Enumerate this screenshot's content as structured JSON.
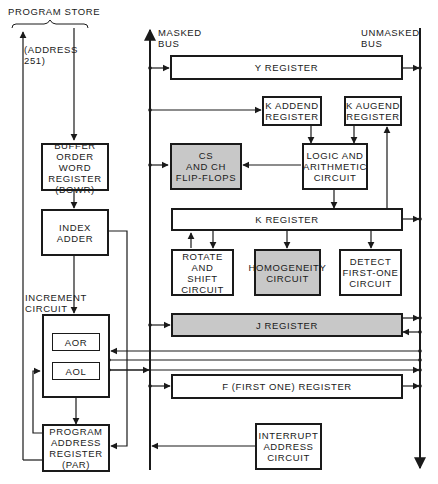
{
  "labels": {
    "program_store": "PROGRAM STORE",
    "address_251": "(ADDRESS\n251)",
    "masked_bus": "MASKED\nBUS",
    "unmasked_bus": "UNMASKED\nBUS",
    "increment_circuit": "INCREMENT\nCIRCUIT",
    "increment_value": "(251+1)"
  },
  "blocks": {
    "bowr": "BUFFER\nORDER WORD\nREGISTER\n(BOWR)",
    "index_adder": "INDEX\nADDER",
    "aor": "AOR",
    "aol": "AOL",
    "par": "PROGRAM\nADDRESS\nREGISTER\n(PAR)",
    "y_register": "Y REGISTER",
    "k_addend": "K ADDEND\nREGISTER",
    "k_augend": "K AUGEND\nREGISTER",
    "cs_ch": "CS\nAND CH\nFLIP-FLOPS",
    "logic_arith": "LOGIC AND\nARITHMETIC\nCIRCUIT",
    "k_register": "K REGISTER",
    "rotate_shift": "ROTATE\nAND\nSHIFT\nCIRCUIT",
    "homogeneity": "HOMOGENEITY\nCIRCUIT",
    "detect_first_one": "DETECT\nFIRST-ONE\nCIRCUIT",
    "j_register": "J REGISTER",
    "f_register": "F (FIRST ONE) REGISTER",
    "interrupt": "INTERRUPT\nADDRESS\nCIRCUIT"
  },
  "colors": {
    "line": "#1a1a1a",
    "shaded_block": "#c8c8c8",
    "background": "#ffffff"
  }
}
